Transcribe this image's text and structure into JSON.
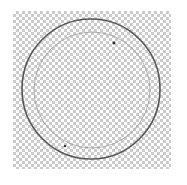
{
  "document": {
    "title": "Untitled Canvas",
    "background_mode": "transparent",
    "width_px": 187,
    "height_px": 185
  },
  "checkerboard": {
    "name": "transparency-checkerboard",
    "light_color": "#ffffff",
    "dark_color": "#cbcbcb",
    "cell_size_px": 3,
    "left": 13,
    "top": 11,
    "width": 158,
    "height": 158
  },
  "shapes": [
    {
      "id": "outer-circle",
      "label": "Outer circle",
      "type": "ellipse",
      "cx": 91,
      "cy": 89,
      "rx": 69,
      "ry": 70,
      "stroke": "#555555",
      "stroke_width": 1.6,
      "fill": "none",
      "opacity": 1
    },
    {
      "id": "inner-circle",
      "label": "Inner circle",
      "type": "ellipse",
      "cx": 92,
      "cy": 90,
      "rx": 58,
      "ry": 58,
      "stroke": "#9a9a9a",
      "stroke_width": 0.9,
      "fill": "none",
      "opacity": 0.85
    }
  ],
  "handles": [
    {
      "id": "handle-top-right",
      "label": "Anchor point",
      "x": 114,
      "y": 43,
      "size": 2.6,
      "color": "#2a2a2a"
    },
    {
      "id": "handle-bottom-left",
      "label": "Anchor point",
      "x": 65,
      "y": 146,
      "size": 2.2,
      "color": "#3a3a3a"
    }
  ],
  "colors": {
    "canvas_background": "#ffffff",
    "stroke_primary": "#555555",
    "stroke_secondary": "#9a9a9a",
    "handle": "#2a2a2a"
  }
}
